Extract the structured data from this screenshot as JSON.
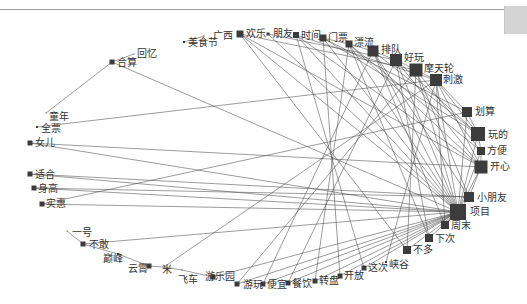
{
  "diagram": {
    "type": "network",
    "hub": "项目",
    "nodes": [
      {
        "id": "美食节",
        "x": 184,
        "y": 42,
        "size": 2,
        "lx": 188,
        "ly": 38
      },
      {
        "id": "广西",
        "x": 204,
        "y": 36,
        "size": 1,
        "lx": 213,
        "ly": 31
      },
      {
        "id": "欢乐",
        "x": 240,
        "y": 34,
        "size": 7,
        "lx": 246,
        "ly": 29
      },
      {
        "id": "朋友",
        "x": 268,
        "y": 34,
        "size": 3,
        "lx": 273,
        "ly": 29
      },
      {
        "id": "时间",
        "x": 296,
        "y": 35,
        "size": 6,
        "lx": 301,
        "ly": 31
      },
      {
        "id": "门票",
        "x": 323,
        "y": 38,
        "size": 7,
        "lx": 328,
        "ly": 33
      },
      {
        "id": "漂流",
        "x": 349,
        "y": 44,
        "size": 7,
        "lx": 354,
        "ly": 38
      },
      {
        "id": "排队",
        "x": 373,
        "y": 51,
        "size": 11,
        "lx": 381,
        "ly": 45
      },
      {
        "id": "好玩",
        "x": 396,
        "y": 60,
        "size": 12,
        "lx": 404,
        "ly": 53
      },
      {
        "id": "摩天轮",
        "x": 416,
        "y": 70,
        "size": 13,
        "lx": 424,
        "ly": 64
      },
      {
        "id": "刺激",
        "x": 436,
        "y": 80,
        "size": 12,
        "lx": 443,
        "ly": 75
      },
      {
        "id": "划算",
        "x": 467,
        "y": 112,
        "size": 10,
        "lx": 475,
        "ly": 107
      },
      {
        "id": "玩的",
        "x": 478,
        "y": 134,
        "size": 14,
        "lx": 488,
        "ly": 130
      },
      {
        "id": "方便",
        "x": 481,
        "y": 151,
        "size": 8,
        "lx": 487,
        "ly": 146
      },
      {
        "id": "开心",
        "x": 481,
        "y": 167,
        "size": 13,
        "lx": 490,
        "ly": 162
      },
      {
        "id": "小朋友",
        "x": 469,
        "y": 197,
        "size": 10,
        "lx": 477,
        "ly": 193
      },
      {
        "id": "项目",
        "x": 458,
        "y": 212,
        "size": 16,
        "lx": 470,
        "ly": 207
      },
      {
        "id": "周末",
        "x": 445,
        "y": 225,
        "size": 8,
        "lx": 451,
        "ly": 221
      },
      {
        "id": "下次",
        "x": 429,
        "y": 238,
        "size": 8,
        "lx": 435,
        "ly": 234
      },
      {
        "id": "不多",
        "x": 407,
        "y": 250,
        "size": 8,
        "lx": 413,
        "ly": 245
      },
      {
        "id": "峡谷",
        "x": 386,
        "y": 262,
        "size": 2,
        "lx": 389,
        "ly": 260
      },
      {
        "id": "这次",
        "x": 364,
        "y": 268,
        "size": 5,
        "lx": 368,
        "ly": 263
      },
      {
        "id": "开放",
        "x": 340,
        "y": 276,
        "size": 5,
        "lx": 344,
        "ly": 271
      },
      {
        "id": "转盘",
        "x": 315,
        "y": 281,
        "size": 5,
        "lx": 319,
        "ly": 276
      },
      {
        "id": "餐饮",
        "x": 288,
        "y": 283,
        "size": 5,
        "lx": 292,
        "ly": 279
      },
      {
        "id": "便宜",
        "x": 263,
        "y": 284,
        "size": 5,
        "lx": 267,
        "ly": 280
      },
      {
        "id": "游玩",
        "x": 237,
        "y": 284,
        "size": 5,
        "lx": 243,
        "ly": 280
      },
      {
        "id": "游乐园",
        "x": 213,
        "y": 277,
        "size": 5,
        "lx": 205,
        "ly": 272
      },
      {
        "id": "飞车",
        "x": 182,
        "y": 270,
        "size": 1,
        "lx": 178,
        "ly": 275
      },
      {
        "id": "米",
        "x": 164,
        "y": 267,
        "size": 1,
        "lx": 162,
        "ly": 265
      },
      {
        "id": "云霄",
        "x": 149,
        "y": 266,
        "size": 5,
        "lx": 128,
        "ly": 264
      },
      {
        "id": "巅峰",
        "x": 118,
        "y": 254,
        "size": 2,
        "lx": 103,
        "ly": 254
      },
      {
        "id": "不敢",
        "x": 83,
        "y": 244,
        "size": 5,
        "lx": 89,
        "ly": 240
      },
      {
        "id": "一号",
        "x": 67,
        "y": 231,
        "size": 1,
        "lx": 72,
        "ly": 228
      },
      {
        "id": "实惠",
        "x": 42,
        "y": 204,
        "size": 5,
        "lx": 46,
        "ly": 199
      },
      {
        "id": "身高",
        "x": 34,
        "y": 188,
        "size": 5,
        "lx": 38,
        "ly": 184
      },
      {
        "id": "适合",
        "x": 30,
        "y": 174,
        "size": 5,
        "lx": 35,
        "ly": 170
      },
      {
        "id": "女儿",
        "x": 30,
        "y": 143,
        "size": 5,
        "lx": 35,
        "ly": 138
      },
      {
        "id": "全票",
        "x": 37,
        "y": 127,
        "size": 2,
        "lx": 41,
        "ly": 124
      },
      {
        "id": "童年",
        "x": 46,
        "y": 113,
        "size": 1,
        "lx": 49,
        "ly": 112
      },
      {
        "id": "合算",
        "x": 112,
        "y": 62,
        "size": 5,
        "lx": 117,
        "ly": 58
      },
      {
        "id": "回忆",
        "x": 134,
        "y": 54,
        "size": 1,
        "lx": 137,
        "ly": 49
      }
    ],
    "edges": [
      [
        "合算",
        "回忆"
      ],
      [
        "合算",
        "童年"
      ],
      [
        "合算",
        "项目"
      ],
      [
        "全票",
        "刺激"
      ],
      [
        "女儿",
        "项目"
      ],
      [
        "适合",
        "项目"
      ],
      [
        "身高",
        "项目"
      ],
      [
        "实惠",
        "项目"
      ],
      [
        "一号",
        "不敢"
      ],
      [
        "不敢",
        "巅峰"
      ],
      [
        "巅峰",
        "云霄"
      ],
      [
        "云霄",
        "米"
      ],
      [
        "米",
        "飞车"
      ],
      [
        "飞车",
        "游乐园"
      ],
      [
        "不敢",
        "项目"
      ],
      [
        "米",
        "刺激"
      ],
      [
        "游乐园",
        "项目"
      ],
      [
        "游玩",
        "项目"
      ],
      [
        "便宜",
        "项目"
      ],
      [
        "餐饮",
        "项目"
      ],
      [
        "转盘",
        "项目"
      ],
      [
        "开放",
        "项目"
      ],
      [
        "这次",
        "项目"
      ],
      [
        "峡谷",
        "刺激"
      ],
      [
        "不多",
        "项目"
      ],
      [
        "下次",
        "项目"
      ],
      [
        "周末",
        "项目"
      ],
      [
        "美食节",
        "广西"
      ],
      [
        "欢乐",
        "项目"
      ],
      [
        "欢乐",
        "开心"
      ],
      [
        "朋友",
        "项目"
      ],
      [
        "时间",
        "项目"
      ],
      [
        "时间",
        "开心"
      ],
      [
        "门票",
        "项目"
      ],
      [
        "门票",
        "划算"
      ],
      [
        "漂流",
        "项目"
      ],
      [
        "漂流",
        "开心"
      ],
      [
        "排队",
        "项目"
      ],
      [
        "排队",
        "小朋友"
      ],
      [
        "好玩",
        "项目"
      ],
      [
        "好玩",
        "开心"
      ],
      [
        "摩天轮",
        "项目"
      ],
      [
        "摩天轮",
        "小朋友"
      ],
      [
        "刺激",
        "项目"
      ],
      [
        "刺激",
        "开心"
      ],
      [
        "划算",
        "项目"
      ],
      [
        "玩的",
        "项目"
      ],
      [
        "方便",
        "项目"
      ],
      [
        "开心",
        "项目"
      ],
      [
        "小朋友",
        "项目"
      ],
      [
        "排队",
        "好玩"
      ],
      [
        "好玩",
        "摩天轮"
      ],
      [
        "摩天轮",
        "刺激"
      ],
      [
        "漂流",
        "排队"
      ],
      [
        "门票",
        "漂流"
      ],
      [
        "欢乐",
        "摩天轮"
      ],
      [
        "朋友",
        "好玩"
      ],
      [
        "时间",
        "刺激"
      ],
      [
        "门票",
        "玩的"
      ],
      [
        "漂流",
        "方便"
      ],
      [
        "排队",
        "玩的"
      ],
      [
        "好玩",
        "玩的"
      ],
      [
        "摩天轮",
        "方便"
      ],
      [
        "刺激",
        "划算"
      ],
      [
        "刺激",
        "玩的"
      ],
      [
        "划算",
        "玩的"
      ],
      [
        "玩的",
        "方便"
      ],
      [
        "方便",
        "开心"
      ],
      [
        "开心",
        "小朋友"
      ],
      [
        "排队",
        "周末"
      ],
      [
        "好玩",
        "下次"
      ],
      [
        "摩天轮",
        "不多"
      ],
      [
        "刺激",
        "周末"
      ],
      [
        "漂流",
        "下次"
      ],
      [
        "欢乐",
        "不多"
      ],
      [
        "时间",
        "这次"
      ],
      [
        "门票",
        "开放"
      ],
      [
        "排队",
        "便宜"
      ],
      [
        "好玩",
        "餐饮"
      ],
      [
        "漂流",
        "转盘"
      ],
      [
        "摩天轮",
        "游玩"
      ],
      [
        "女儿",
        "开心"
      ],
      [
        "适合",
        "小朋友"
      ],
      [
        "身高",
        "小朋友"
      ],
      [
        "实惠",
        "划算"
      ]
    ]
  },
  "window": {
    "scrollbar": "vertical-scrollbar-thumb"
  }
}
